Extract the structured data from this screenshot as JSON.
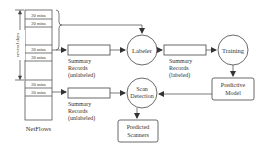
{
  "diagram": {
    "netflows": {
      "label": "NetFlows",
      "cell_label": "20 mins",
      "duration_label": "several days"
    },
    "summary_unlabeled_top": {
      "line1": "Summary",
      "line2": "Records",
      "line3": "(unlabeled)"
    },
    "summary_unlabeled_bottom": {
      "line1": "Summary",
      "line2": "Records",
      "line3": "(unlabeled)"
    },
    "summary_labeled": {
      "line1": "Summary",
      "line2": "Records",
      "line3": "(labeled)"
    },
    "labeler": {
      "label": "Labeler"
    },
    "training": {
      "label": "Training"
    },
    "scan_detection": {
      "line1": "Scan",
      "line2": "Detection"
    },
    "predictive_model": {
      "line1": "Predictive",
      "line2": "Model"
    },
    "predicted_scanners": {
      "line1": "Predicted",
      "line2": "Scanners"
    },
    "colors": {
      "stroke": "#444444",
      "text": "#333333",
      "background": "#ffffff"
    }
  }
}
